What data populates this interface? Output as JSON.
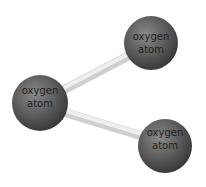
{
  "diagram": {
    "title": "",
    "colors": {
      "atom": "#5a5a5a",
      "bond": "#d8d8d8",
      "text": "#1e1e1e"
    },
    "atoms": [
      {
        "id": "top",
        "line1": "oxygen",
        "line2": "atom",
        "cx": 151,
        "cy": 43,
        "r": 27
      },
      {
        "id": "left",
        "line1": "oxygen",
        "line2": "atom",
        "cx": 40,
        "cy": 103,
        "r": 28
      },
      {
        "id": "bottom",
        "line1": "oxygen",
        "line2": "atom",
        "cx": 165,
        "cy": 146,
        "r": 27
      }
    ],
    "bonds": [
      {
        "from": "left",
        "to": "top"
      },
      {
        "from": "left",
        "to": "bottom"
      }
    ]
  }
}
